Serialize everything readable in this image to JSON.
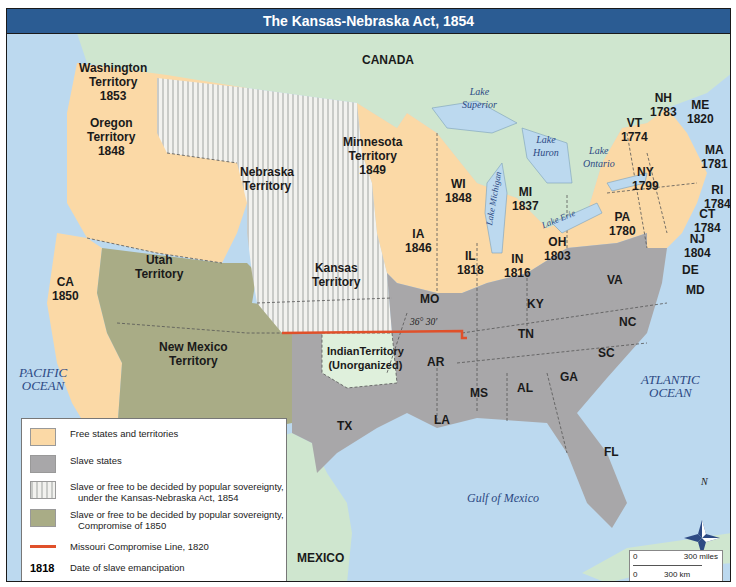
{
  "title": "The Kansas-Nebraska Act, 1854",
  "colors": {
    "free": "#fbd9a6",
    "slave": "#a8a7a9",
    "popular_sovereignty_1854": "#e6e6e3",
    "popular_sovereignty_1850": "#a9ac86",
    "foreign_land": "#cfe6cf",
    "water": "#bcd9ef",
    "missouri_line": "#e0502a",
    "title_bar": "#2b5c93"
  },
  "regions": {
    "canada": "CANADA",
    "mexico": "MEXICO",
    "washington": {
      "name": "Washington",
      "sub": "Territory",
      "year": "1853"
    },
    "oregon": {
      "name": "Oregon",
      "sub": "Territory",
      "year": "1848"
    },
    "nebraska": {
      "name": "Nebraska",
      "sub": "Territory"
    },
    "minnesota": {
      "name": "Minnesota",
      "sub": "Territory",
      "year": "1849"
    },
    "utah": {
      "name": "Utah",
      "sub": "Territory"
    },
    "new_mexico": {
      "name": "New Mexico",
      "sub": "Territory"
    },
    "kansas": {
      "name": "Kansas",
      "sub": "Territory"
    },
    "indian": {
      "name": "IndianTerritory",
      "sub": "(Unorganized)"
    },
    "ca": {
      "name": "CA",
      "year": "1850"
    },
    "wi": {
      "name": "WI",
      "year": "1848"
    },
    "mi": {
      "name": "MI",
      "year": "1837"
    },
    "ia": {
      "name": "IA",
      "year": "1846"
    },
    "il": {
      "name": "IL",
      "year": "1818"
    },
    "in": {
      "name": "IN",
      "year": "1816"
    },
    "oh": {
      "name": "OH",
      "year": "1803"
    },
    "pa": {
      "name": "PA",
      "year": "1780"
    },
    "ny": {
      "name": "NY",
      "year": "1799"
    },
    "vt": {
      "name": "VT",
      "year": "1774"
    },
    "nh": {
      "name": "NH",
      "year": "1783"
    },
    "me": {
      "name": "ME",
      "year": "1820"
    },
    "ma": {
      "name": "MA",
      "year": "1781"
    },
    "ri": {
      "name": "RI",
      "year": "1784"
    },
    "ct": {
      "name": "CT",
      "year": "1784"
    },
    "nj": {
      "name": "NJ",
      "year": "1804"
    },
    "de": "DE",
    "md": "MD",
    "va": "VA",
    "ky": "KY",
    "nc": "NC",
    "tn": "TN",
    "sc": "SC",
    "mo": "MO",
    "ar": "AR",
    "ms": "MS",
    "al": "AL",
    "ga": "GA",
    "la": "LA",
    "tx": "TX",
    "fl": "FL"
  },
  "water": {
    "lake_superior": [
      "Lake",
      "Superior"
    ],
    "lake_michigan": "Lake Michigan",
    "lake_huron": [
      "Lake",
      "Huron"
    ],
    "lake_ontario": [
      "Lake",
      "Ontario"
    ],
    "lake_erie": "Lake Erie",
    "pacific": [
      "PACIFIC",
      "OCEAN"
    ],
    "atlantic": [
      "ATLANTIC",
      "OCEAN"
    ],
    "gulf": "Gulf of Mexico"
  },
  "missouri_line_label": "36° 30′",
  "compass": "N",
  "legend": {
    "items": [
      {
        "type": "free",
        "text": [
          "Free states and territories"
        ]
      },
      {
        "type": "slave",
        "text": [
          "Slave states"
        ]
      },
      {
        "type": "ps1854",
        "text": [
          "Slave or free to be decided by popular sovereignty,",
          "under the Kansas-Nebraska Act, 1854"
        ]
      },
      {
        "type": "ps1850",
        "text": [
          "Slave or free to be decided by popular sovereignty,",
          "Compromise of 1850"
        ]
      },
      {
        "type": "line",
        "text": [
          "Missouri Compromise Line, 1820"
        ]
      },
      {
        "type": "date",
        "sample": "1818",
        "text": [
          "Date of slave emancipation"
        ]
      }
    ]
  },
  "scale": {
    "zero": "0",
    "miles": "300 miles",
    "km": "300 km"
  }
}
